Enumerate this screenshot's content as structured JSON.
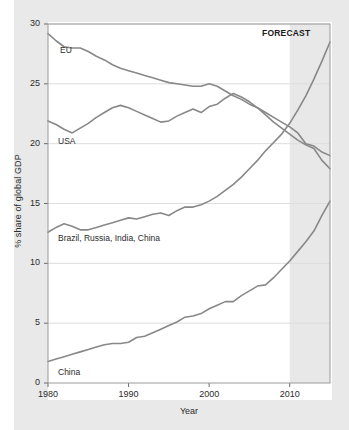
{
  "chart_data": {
    "type": "line",
    "title": "",
    "xlabel": "Year",
    "ylabel": "% share of global GDP",
    "xlim": [
      1980,
      2015
    ],
    "ylim": [
      0,
      30
    ],
    "xticks": [
      1980,
      1990,
      2000,
      2010
    ],
    "yticks": [
      0,
      5,
      10,
      15,
      20,
      25,
      30
    ],
    "grid": "horizontal",
    "legend_position": "inline-labels",
    "annotations": [
      {
        "text": "FORECAST",
        "x": 2014,
        "y": 29.3,
        "note": "shaded band covers 2010-2015"
      }
    ],
    "shaded_regions": [
      {
        "label": "FORECAST",
        "x_start": 2010,
        "x_end": 2015,
        "color": "#e8e8e8"
      }
    ],
    "series": [
      {
        "name": "EU",
        "color": "#888888",
        "x": [
          1980,
          1981,
          1982,
          1983,
          1984,
          1985,
          1986,
          1987,
          1988,
          1989,
          1990,
          1991,
          1992,
          1993,
          1994,
          1995,
          1996,
          1997,
          1998,
          1999,
          2000,
          2001,
          2002,
          2003,
          2004,
          2005,
          2006,
          2007,
          2008,
          2009,
          2010,
          2011,
          2012,
          2013,
          2014,
          2015
        ],
        "values": [
          29.2,
          28.6,
          28.1,
          28.0,
          28.0,
          27.7,
          27.3,
          27.0,
          26.6,
          26.3,
          26.1,
          25.9,
          25.7,
          25.5,
          25.3,
          25.1,
          25.0,
          24.9,
          24.8,
          24.8,
          25.0,
          24.8,
          24.4,
          24.0,
          23.7,
          23.3,
          23.0,
          22.6,
          22.2,
          21.8,
          21.4,
          20.9,
          20.0,
          19.8,
          19.3,
          19.0
        ]
      },
      {
        "name": "USA",
        "color": "#888888",
        "x": [
          1980,
          1981,
          1982,
          1983,
          1984,
          1985,
          1986,
          1987,
          1988,
          1989,
          1990,
          1991,
          1992,
          1993,
          1994,
          1995,
          1996,
          1997,
          1998,
          1999,
          2000,
          2001,
          2002,
          2003,
          2004,
          2005,
          2006,
          2007,
          2008,
          2009,
          2010,
          2011,
          2012,
          2013,
          2014,
          2015
        ],
        "values": [
          21.9,
          21.6,
          21.2,
          20.9,
          21.3,
          21.7,
          22.2,
          22.6,
          23.0,
          23.2,
          23.0,
          22.7,
          22.4,
          22.1,
          21.8,
          21.9,
          22.3,
          22.6,
          22.9,
          22.6,
          23.1,
          23.3,
          23.8,
          24.2,
          23.9,
          23.5,
          23.0,
          22.4,
          21.8,
          21.3,
          20.8,
          20.3,
          19.9,
          19.6,
          18.6,
          17.9
        ]
      },
      {
        "name": "Brazil, Russia, India, China",
        "color": "#888888",
        "x": [
          1980,
          1981,
          1982,
          1983,
          1984,
          1985,
          1986,
          1987,
          1988,
          1989,
          1990,
          1991,
          1992,
          1993,
          1994,
          1995,
          1996,
          1997,
          1998,
          1999,
          2000,
          2001,
          2002,
          2003,
          2004,
          2005,
          2006,
          2007,
          2008,
          2009,
          2010,
          2011,
          2012,
          2013,
          2014,
          2015
        ],
        "values": [
          12.6,
          13.0,
          13.3,
          13.1,
          12.8,
          12.8,
          13.0,
          13.2,
          13.4,
          13.6,
          13.8,
          13.7,
          13.9,
          14.1,
          14.2,
          14.0,
          14.4,
          14.7,
          14.7,
          14.9,
          15.2,
          15.6,
          16.1,
          16.6,
          17.2,
          17.9,
          18.6,
          19.4,
          20.1,
          20.8,
          21.7,
          22.8,
          24.0,
          25.4,
          26.9,
          28.5
        ]
      },
      {
        "name": "China",
        "color": "#888888",
        "x": [
          1980,
          1981,
          1982,
          1983,
          1984,
          1985,
          1986,
          1987,
          1988,
          1989,
          1990,
          1991,
          1992,
          1993,
          1994,
          1995,
          1996,
          1997,
          1998,
          1999,
          2000,
          2001,
          2002,
          2003,
          2004,
          2005,
          2006,
          2007,
          2008,
          2009,
          2010,
          2011,
          2012,
          2013,
          2014,
          2015
        ],
        "values": [
          1.8,
          2.0,
          2.2,
          2.4,
          2.6,
          2.8,
          3.0,
          3.2,
          3.3,
          3.3,
          3.4,
          3.8,
          3.9,
          4.2,
          4.5,
          4.8,
          5.1,
          5.5,
          5.6,
          5.8,
          6.2,
          6.5,
          6.8,
          6.8,
          7.3,
          7.7,
          8.1,
          8.2,
          8.8,
          9.5,
          10.2,
          11.0,
          11.8,
          12.7,
          14.0,
          15.2
        ]
      }
    ]
  },
  "axis": {
    "ylabel": "% share of global GDP",
    "xlabel": "Year",
    "ytick_labels": [
      "0",
      "5",
      "10",
      "15",
      "20",
      "25",
      "30"
    ],
    "xtick_labels": [
      "1980",
      "1990",
      "2000",
      "2010"
    ]
  },
  "labels": {
    "eu": "EU",
    "usa": "USA",
    "bric": "Brazil, Russia, India, China",
    "china": "China",
    "forecast": "FORECAST"
  },
  "colors": {
    "line": "#888888",
    "forecast_band": "#e8e8e8",
    "outer_band": "#e9e9e9",
    "grid": "#dddddd",
    "text": "#2b2b2b",
    "plot_bg": "#ffffff"
  }
}
